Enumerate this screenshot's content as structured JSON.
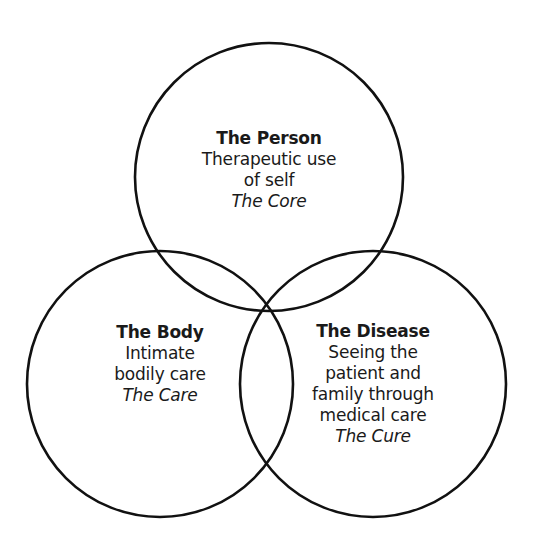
{
  "diagram": {
    "type": "venn",
    "stroke_color": "#111111",
    "background": "#ffffff",
    "circles": [
      {
        "id": "person",
        "title": "The Person",
        "lines": [
          "Therapeutic use",
          "of self"
        ],
        "tag": "The Core"
      },
      {
        "id": "body",
        "title": "The Body",
        "lines": [
          "Intimate",
          "bodily care"
        ],
        "tag": "The Care"
      },
      {
        "id": "disease",
        "title": "The Disease",
        "lines": [
          "Seeing the",
          "patient and",
          "family through",
          "medical care"
        ],
        "tag": "The Cure"
      }
    ]
  }
}
